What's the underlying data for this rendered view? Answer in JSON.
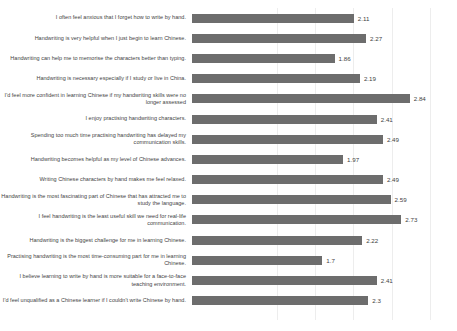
{
  "chart_data": {
    "type": "bar",
    "orientation": "horizontal",
    "title": "",
    "subtitle": "",
    "xlabel": "",
    "ylabel": "",
    "xlim": [
      0,
      3.0
    ],
    "grid": true,
    "grid_axis": "x",
    "legend": false,
    "bar_color": "#6d6d6d",
    "gridline_color": "#ededed",
    "text_color": "#3f3f3f",
    "gridline_values": [
      1.0,
      1.5,
      2.0,
      2.5,
      3.0
    ],
    "data_labels": true,
    "categories": [
      "I often feel anxious that I forget how to write by hand.",
      "Handwriting is very helpful when I just begin to learn Chinese.",
      "Handwriting can help me to memorise the characters better than typing.",
      "Handwriting is necessary especially if I study or live in China.",
      "I'd feel more confident in learning Chinese if my handwriting skills were no longer assessed",
      "I enjoy practising handwriting characters.",
      "Spending too much time practising handwriting has delayed my communication skills.",
      "Handwriting becomes helpful as my level of Chinese advances.",
      "Writing Chinese characters by hand makes me feel relaxed.",
      "Handwriting is the most fascinating part of Chinese that has attracted me to study the language.",
      "I feel handwriting is the least useful skill we need for real-life communication.",
      "Handwriting is the biggest challenge for me in learning Chinese.",
      "Practising handwriting is the most time-consuming part for me in learning Chinese.",
      "I believe learning to write by hand is more suitable for a face-to-face teaching environment.",
      "I'd feel unqualified as a Chinese learner if I couldn't write Chinese by hand."
    ],
    "values": [
      2.11,
      2.27,
      1.86,
      2.19,
      2.84,
      2.41,
      2.49,
      1.97,
      2.49,
      2.59,
      2.73,
      2.22,
      1.7,
      2.41,
      2.3
    ],
    "value_labels": [
      "2.11",
      "2.27",
      "1.86",
      "2.19",
      "2.84",
      "2.41",
      "2.49",
      "1.97",
      "2.49",
      "2.59",
      "2.73",
      "2.22",
      "1.7",
      "2.41",
      "2.3"
    ]
  }
}
